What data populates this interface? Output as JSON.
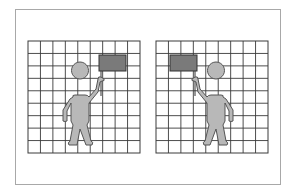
{
  "figure": {
    "grid": {
      "columns": 9,
      "rows": 9,
      "line_color": "#3a3a3a",
      "background": "#ffffff"
    },
    "colors": {
      "frame": "#a8a8a8",
      "figure_fill": "#b8b8b8",
      "figure_outline": "#555555",
      "flag_fill": "#7a7a7a",
      "flag_outline": "#333333"
    },
    "panels": [
      {
        "name": "left-panel",
        "grid_x": 28,
        "grid_y": 41,
        "flag_side": "right",
        "figure_faces": "right-arm-raised"
      },
      {
        "name": "right-panel",
        "grid_x": 156,
        "grid_y": 41,
        "flag_side": "left",
        "figure_faces": "left-arm-raised"
      }
    ]
  }
}
